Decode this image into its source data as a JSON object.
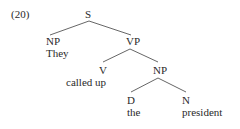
{
  "example_number": "(20)",
  "tree": {
    "root": {
      "label": "S",
      "children": [
        {
          "label": "NP",
          "word": "They"
        },
        {
          "label": "VP",
          "children": [
            {
              "label": "V",
              "word": "called up"
            },
            {
              "label": "NP",
              "children": [
                {
                  "label": "D",
                  "word": "the"
                },
                {
                  "label": "N",
                  "word": "president"
                }
              ]
            }
          ]
        }
      ]
    }
  },
  "colors": {
    "text": "#2a2a2a",
    "edge": "#555555",
    "background": "#ffffff"
  }
}
